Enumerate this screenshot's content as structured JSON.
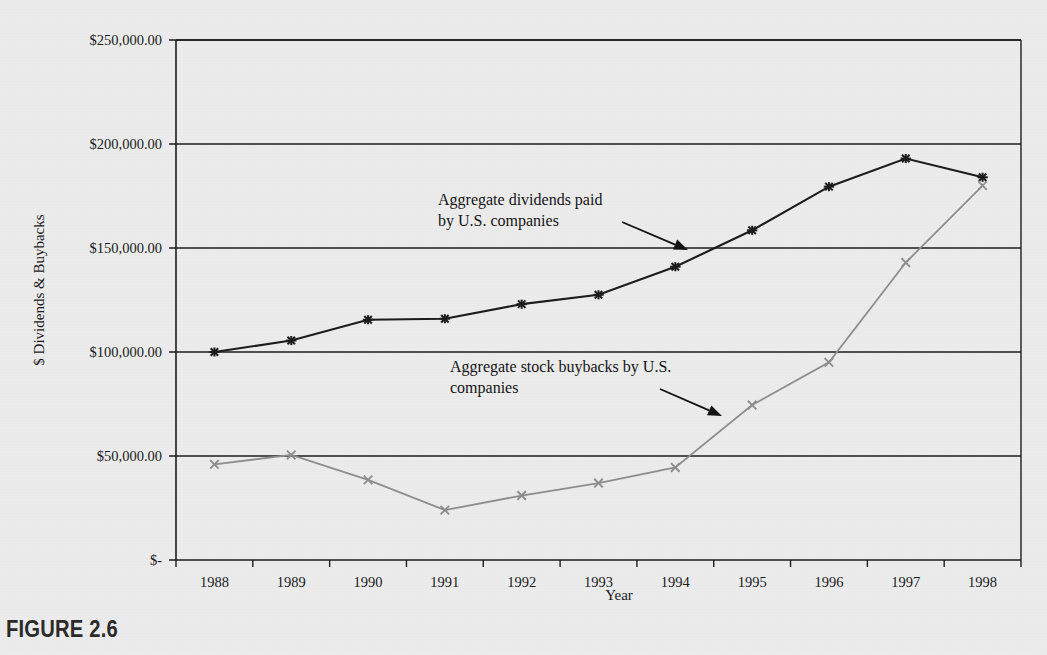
{
  "figure": {
    "caption": "FIGURE 2.6"
  },
  "chart_data": {
    "type": "line",
    "title": "",
    "xlabel": "Year",
    "ylabel": "$ Dividends & Buybacks",
    "categories": [
      "1988",
      "1989",
      "1990",
      "1991",
      "1992",
      "1993",
      "1994",
      "1995",
      "1996",
      "1997",
      "1998"
    ],
    "ylim": [
      0,
      250000
    ],
    "yticks": [
      0,
      50000,
      100000,
      150000,
      200000,
      250000
    ],
    "ytick_labels": [
      "$-",
      "$50,000.00",
      "$100,000.00",
      "$150,000.00",
      "$200,000.00",
      "$250,000.00"
    ],
    "grid": true,
    "legend": "none",
    "series": [
      {
        "name": "Aggregate dividends paid by U.S. companies",
        "color": "#1c1c1c",
        "marker": "asterisk",
        "values": [
          100000,
          105500,
          115500,
          116000,
          123000,
          127500,
          141000,
          158500,
          179500,
          193000,
          184000
        ]
      },
      {
        "name": "Aggregate stock buybacks by U.S. companies",
        "color": "#8d8d8d",
        "marker": "x",
        "values": [
          46000,
          50500,
          38500,
          24000,
          31000,
          37000,
          44500,
          74500,
          95000,
          143000,
          180000
        ]
      }
    ],
    "annotations": [
      {
        "id": "dividends-annotation",
        "line1": "Aggregate dividends paid",
        "line2": "by U.S. companies",
        "text_x": 438,
        "text_y": 205,
        "arrow_from_x": 622,
        "arrow_from_y": 222,
        "arrow_to_x": 688,
        "arrow_to_y": 250
      },
      {
        "id": "buybacks-annotation",
        "line1": "Aggregate stock buybacks by U.S.",
        "line2": "companies",
        "text_x": 450,
        "text_y": 372,
        "arrow_from_x": 660,
        "arrow_from_y": 389,
        "arrow_to_x": 722,
        "arrow_to_y": 416
      }
    ]
  }
}
